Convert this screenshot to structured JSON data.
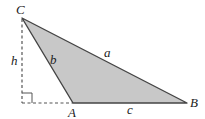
{
  "diagram": {
    "vertices": {
      "A": {
        "label": "A",
        "x": 73,
        "y": 103
      },
      "B": {
        "label": "B",
        "x": 187,
        "y": 103
      },
      "C": {
        "label": "C",
        "x": 22,
        "y": 18
      }
    },
    "altitude_foot": {
      "x": 22,
      "y": 103
    },
    "sides": {
      "a": {
        "label": "a",
        "from": "B",
        "to": "C"
      },
      "b": {
        "label": "b",
        "from": "A",
        "to": "C"
      },
      "c": {
        "label": "c",
        "from": "A",
        "to": "B"
      }
    },
    "altitude": {
      "label": "h"
    },
    "colors": {
      "fill": "#c8c8c8",
      "stroke": "#444444",
      "dashed": "#555555",
      "text": "#222222"
    }
  }
}
